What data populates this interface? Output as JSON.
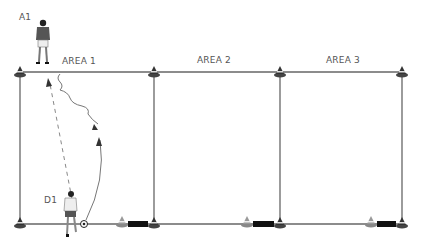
{
  "diagram": {
    "title": "",
    "areas": [
      {
        "label": "AREA 1",
        "x": 90,
        "y": 58
      },
      {
        "label": "AREA 2",
        "x": 198,
        "y": 58
      },
      {
        "label": "AREA 3",
        "x": 325,
        "y": 58
      }
    ],
    "players": [
      {
        "id": "A1",
        "label": "A1",
        "role": "attacker",
        "label_x": 19,
        "label_y": 14
      },
      {
        "id": "D1",
        "label": "D1",
        "role": "defender",
        "label_x": 44,
        "label_y": 196
      }
    ],
    "lines": {
      "top_y": 72,
      "bottom_y": 224,
      "verticals_x": [
        20,
        154,
        280,
        402
      ],
      "color": "#555555"
    },
    "cones_top_x": [
      20,
      154,
      280,
      402
    ],
    "cones_bottom_x": [
      20,
      122,
      154,
      247,
      280,
      371,
      402
    ],
    "mini_goals": [
      {
        "x1": 128,
        "x2": 148
      },
      {
        "x1": 253,
        "x2": 274
      },
      {
        "x1": 377,
        "x2": 396
      }
    ],
    "arrows": [
      {
        "type": "pass-dashed",
        "from": "D1",
        "to": "A1"
      },
      {
        "type": "dribble-wavy",
        "from": "A1"
      },
      {
        "type": "run-curved",
        "from": "D1"
      }
    ]
  }
}
